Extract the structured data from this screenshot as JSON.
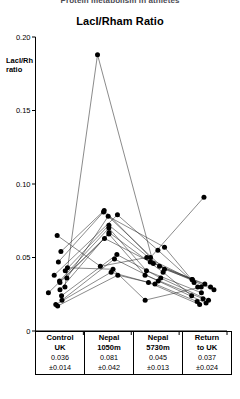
{
  "caption_cut": "Protein metabolism in athletes",
  "chart_data": {
    "type": "line",
    "title": "LacI/Rham Ratio",
    "xlabel": "",
    "ylabel": "LacI/Rh ratio",
    "ylabel_line1": "LacI/Rh",
    "ylabel_line2": "ratio",
    "ylim": [
      0,
      0.2
    ],
    "ytick_labels": [
      "0",
      "0.05",
      "0.10",
      "0.15",
      "0.20"
    ],
    "ytick_values": [
      0,
      0.05,
      0.1,
      0.15,
      0.2
    ],
    "grid": false,
    "legend": "none",
    "categories": [
      "Control UK",
      "Nepal 1050m",
      "Nepal 5730m",
      "Return to UK"
    ],
    "series": [
      {
        "name": "subject-1",
        "values": [
          0.03,
          0.188,
          0.046,
          0.03
        ]
      },
      {
        "name": "subject-2",
        "values": [
          0.054,
          0.082,
          0.05,
          0.091
        ]
      },
      {
        "name": "subject-3",
        "values": [
          0.047,
          0.081,
          0.042,
          0.035
        ]
      },
      {
        "name": "subject-4",
        "values": [
          0.038,
          0.079,
          0.055,
          0.033
        ]
      },
      {
        "name": "subject-5",
        "values": [
          0.036,
          0.078,
          0.057,
          0.03
        ]
      },
      {
        "name": "subject-6",
        "values": [
          0.041,
          0.072,
          0.044,
          0.028
        ]
      },
      {
        "name": "subject-7",
        "values": [
          0.034,
          0.07,
          0.041,
          0.026
        ]
      },
      {
        "name": "subject-8",
        "values": [
          0.028,
          0.067,
          0.04,
          0.024
        ]
      },
      {
        "name": "subject-9",
        "values": [
          0.033,
          0.066,
          0.038,
          0.022
        ]
      },
      {
        "name": "subject-10",
        "values": [
          0.026,
          0.063,
          0.047,
          0.032
        ]
      },
      {
        "name": "subject-11",
        "values": [
          0.024,
          0.052,
          0.036,
          0.021
        ]
      },
      {
        "name": "subject-12",
        "values": [
          0.021,
          0.049,
          0.034,
          0.019
        ]
      },
      {
        "name": "subject-13",
        "values": [
          0.065,
          0.044,
          0.05,
          0.035
        ]
      },
      {
        "name": "subject-14",
        "values": [
          0.043,
          0.042,
          0.021,
          0.03
        ]
      },
      {
        "name": "subject-15",
        "values": [
          0.018,
          0.04,
          0.033,
          0.018
        ]
      },
      {
        "name": "subject-16",
        "values": [
          0.017,
          0.038,
          0.032,
          0.02
        ]
      }
    ],
    "summary": {
      "columns": [
        {
          "label_line1": "Control",
          "label_line2": "UK",
          "mean": "0.036",
          "sd": "±0.014"
        },
        {
          "label_line1": "Nepal",
          "label_line2": "1050m",
          "mean": "0.081",
          "sd": "±0.042"
        },
        {
          "label_line1": "Nepal",
          "label_line2": "5730m",
          "mean": "0.045",
          "sd": "±0.013"
        },
        {
          "label_line1": "Return",
          "label_line2": "to UK",
          "mean": "0.037",
          "sd": "±0.024"
        }
      ]
    }
  }
}
